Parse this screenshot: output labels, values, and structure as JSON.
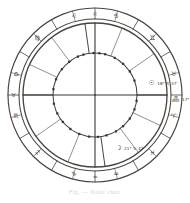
{
  "figure": {
    "kind": "astrological-natal-chart-wheel",
    "caption": "Fig. — Natal chart",
    "ink_color": "#3a3631",
    "paper_color": "#ffffff",
    "line_color": "#4a4540"
  },
  "wheel": {
    "center_x": 95,
    "center_y": 95,
    "outer_radius": 87,
    "zodiac_ring_inner_radius": 76,
    "house_ring_radius": 72,
    "inner_circle_radius": 42,
    "num_zodiac_segments": 12,
    "num_houses": 12
  },
  "zodiac_signs": [
    {
      "index": 0,
      "name": "Libra",
      "glyph": "♎",
      "angle_deg": 0
    },
    {
      "index": 1,
      "name": "Virgo",
      "glyph": "♍",
      "angle_deg": 30
    },
    {
      "index": 2,
      "name": "Leo",
      "glyph": "♌",
      "angle_deg": 60
    },
    {
      "index": 3,
      "name": "Cancer",
      "glyph": "♋",
      "angle_deg": 90
    },
    {
      "index": 4,
      "name": "Gemini",
      "glyph": "♊",
      "angle_deg": 120
    },
    {
      "index": 5,
      "name": "Taurus",
      "glyph": "♉",
      "angle_deg": 150
    },
    {
      "index": 6,
      "name": "Aries",
      "glyph": "♈",
      "angle_deg": 180
    },
    {
      "index": 7,
      "name": "Pisces",
      "glyph": "♓",
      "angle_deg": 210
    },
    {
      "index": 8,
      "name": "Aquarius",
      "glyph": "♒",
      "angle_deg": 240
    },
    {
      "index": 9,
      "name": "Capricorn",
      "glyph": "♑",
      "angle_deg": 270
    },
    {
      "index": 10,
      "name": "Sagittarius",
      "glyph": "♐",
      "angle_deg": 300
    },
    {
      "index": 11,
      "name": "Scorpio",
      "glyph": "♏",
      "angle_deg": 330
    }
  ],
  "angles": {
    "ascendant": {
      "label": "Asc",
      "glyph": "♏",
      "degree_text": "17° ♏ 37'",
      "angle_deg": 180
    },
    "descendant": {
      "label": "Dsc",
      "glyph": "♉",
      "angle_deg": 0
    },
    "midheaven": {
      "label": "MC",
      "glyph": "♌",
      "angle_deg": 90
    },
    "imum_coeli": {
      "label": "IC",
      "glyph": "♒",
      "angle_deg": 270
    }
  },
  "planets": [
    {
      "name": "Sun",
      "glyph": "☉",
      "degree_text": "18° ♏ 37'",
      "angle_deg": 168
    },
    {
      "name": "Moon",
      "glyph": "☽",
      "degree_text": "21° ♑ 42'",
      "angle_deg": 246
    }
  ],
  "house_cusp_angles_deg": [
    180,
    205,
    233,
    262,
    292,
    325,
    0,
    25,
    53,
    82,
    112,
    145
  ],
  "inner_tick_angles_deg": [
    8,
    22,
    38,
    52,
    66,
    74,
    88,
    96,
    104,
    118,
    132,
    146,
    160,
    188,
    200,
    214,
    228,
    240,
    254,
    266,
    278,
    292,
    306,
    320,
    334,
    348
  ],
  "zodiac_tick_angles_deg": [
    0,
    30,
    60,
    90,
    120,
    150,
    180,
    210,
    240,
    270,
    300,
    330,
    15,
    45,
    75,
    105,
    135,
    165,
    195,
    225,
    255,
    285,
    315,
    345
  ]
}
